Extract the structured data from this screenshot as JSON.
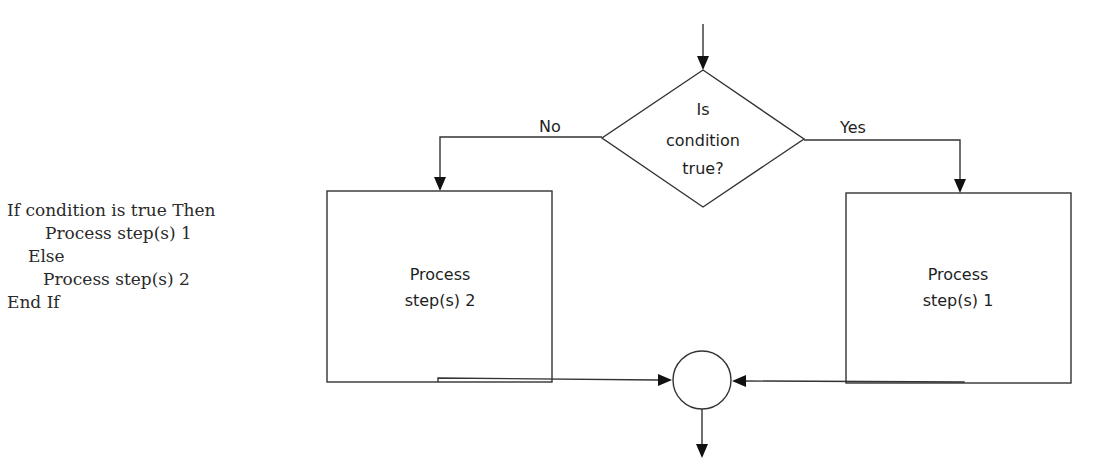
{
  "pseudocode": {
    "lines": [
      {
        "text": "If condition is true Then",
        "indent": 0
      },
      {
        "text": "Process step(s) 1",
        "indent": 2
      },
      {
        "text": "Else",
        "indent": 1
      },
      {
        "text": "Process step(s) 2",
        "indent": 2
      },
      {
        "text": "End If",
        "indent": 0
      }
    ]
  },
  "flowchart": {
    "decision": {
      "line1": "Is",
      "line2": "condition",
      "line3": "true?"
    },
    "branch_no_label": "No",
    "branch_yes_label": "Yes",
    "process_false": {
      "line1": "Process",
      "line2": "step(s) 2"
    },
    "process_true": {
      "line1": "Process",
      "line2": "step(s) 1"
    },
    "connector": "merge-circle"
  },
  "colors": {
    "stroke": "#333333",
    "text": "#1e1e1e",
    "background": "#ffffff"
  }
}
